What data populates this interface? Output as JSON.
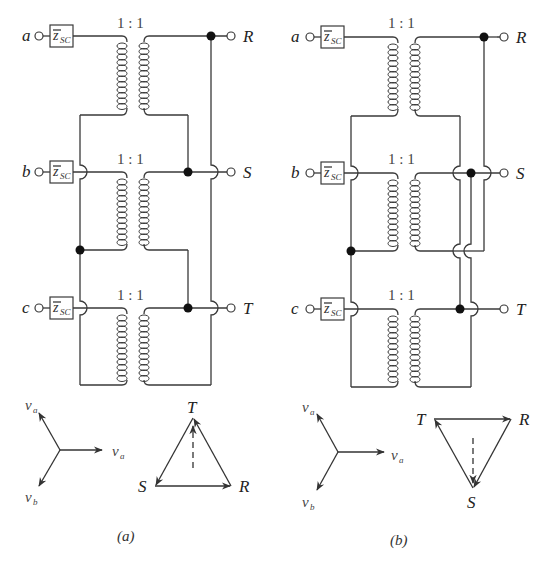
{
  "figure": {
    "panels": [
      {
        "id": "a",
        "caption": "(a)",
        "inputs": [
          "a",
          "b",
          "c"
        ],
        "outputs": [
          "R",
          "S",
          "T"
        ],
        "impedance": {
          "symbol": "z",
          "subscript": "SC"
        },
        "transformers": [
          {
            "ratio": "1 : 1"
          },
          {
            "ratio": "1 : 1"
          },
          {
            "ratio": "1 : 1"
          }
        ],
        "star": {
          "labels": [
            {
              "v": "v",
              "sub": "a"
            },
            {
              "v": "v",
              "sub": "a"
            },
            {
              "v": "v",
              "sub": "b"
            }
          ]
        },
        "triangle": {
          "vertices": [
            "T",
            "S",
            "R"
          ]
        }
      },
      {
        "id": "b",
        "caption": "(b)",
        "inputs": [
          "a",
          "b",
          "c"
        ],
        "outputs": [
          "R",
          "S",
          "T"
        ],
        "impedance": {
          "symbol": "z",
          "subscript": "SC"
        },
        "transformers": [
          {
            "ratio": "1 : 1"
          },
          {
            "ratio": "1 : 1"
          },
          {
            "ratio": "1 : 1"
          }
        ],
        "star": {
          "labels": [
            {
              "v": "v",
              "sub": "a"
            },
            {
              "v": "v",
              "sub": "a"
            },
            {
              "v": "v",
              "sub": "b"
            }
          ]
        },
        "triangle": {
          "vertices": [
            "T",
            "R",
            "S"
          ]
        }
      }
    ]
  }
}
